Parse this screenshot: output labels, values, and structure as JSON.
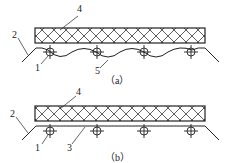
{
  "figure_a": {
    "caption": "（a）",
    "labels": {
      "l1": "1",
      "l2": "2",
      "l4": "4",
      "l5": "5"
    }
  },
  "figure_b": {
    "caption": "（b）",
    "labels": {
      "l1": "1",
      "l2": "2",
      "l3": "3",
      "l4": "4"
    }
  },
  "colors": {
    "line": "#222222",
    "background": "#ffffff"
  }
}
